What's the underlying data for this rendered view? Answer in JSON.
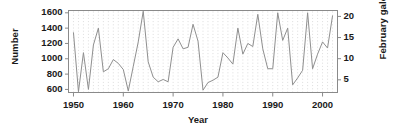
{
  "chart_data": {
    "type": "line",
    "title": "",
    "xlabel": "Year",
    "ylabel": "Number",
    "y2label": "February gales",
    "xlim": [
      1949,
      2003
    ],
    "ylim": [
      560,
      1630
    ],
    "y2lim": [
      2.0,
      21.4
    ],
    "grid": true,
    "grid_style": "dotted-vertical",
    "legend": "none",
    "xticks": [
      1950,
      1960,
      1970,
      1980,
      1990,
      2000
    ],
    "xticklabels": [
      "1950",
      "1960",
      "1970",
      "1980",
      "1990",
      "2000"
    ],
    "yticks": [
      600,
      800,
      1000,
      1200,
      1400,
      1600
    ],
    "yticklabels": [
      "600",
      "800",
      "1000",
      "1200",
      "1400",
      "1600"
    ],
    "y2ticks": [
      5,
      10,
      15,
      20
    ],
    "y2ticklabels": [
      "5",
      "10",
      "15",
      "20"
    ],
    "series": [
      {
        "name": "Number",
        "color": "#8f8f8f",
        "x": [
          1950,
          1951,
          1952,
          1953,
          1954,
          1955,
          1956,
          1957,
          1958,
          1959,
          1960,
          1961,
          1962,
          1963,
          1964,
          1965,
          1966,
          1967,
          1968,
          1969,
          1970,
          1971,
          1972,
          1973,
          1974,
          1975,
          1976,
          1977,
          1978,
          1979,
          1980,
          1981,
          1982,
          1983,
          1984,
          1985,
          1986,
          1987,
          1988,
          1989,
          1990,
          1991,
          1992,
          1993,
          1994,
          1995,
          1996,
          1997,
          1998,
          1999,
          2000,
          2001,
          2002
        ],
        "values": [
          1340,
          570,
          1080,
          600,
          1180,
          1400,
          830,
          870,
          990,
          940,
          860,
          580,
          900,
          1220,
          1620,
          960,
          760,
          700,
          730,
          700,
          1150,
          1260,
          1130,
          1150,
          1450,
          1230,
          590,
          690,
          720,
          760,
          1080,
          1010,
          930,
          1400,
          1060,
          1200,
          1160,
          1580,
          1130,
          870,
          870,
          1600,
          1240,
          1400,
          660,
          750,
          850,
          1600,
          870,
          1060,
          1220,
          1140,
          1560
        ]
      }
    ]
  },
  "axes": {
    "left_label": "Number",
    "right_label": "February gales",
    "bottom_label": "Year"
  }
}
